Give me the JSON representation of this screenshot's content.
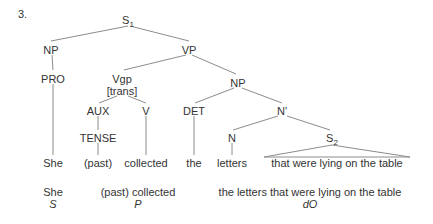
{
  "item": {
    "number": "3."
  },
  "colors": {
    "background": "#ffffff",
    "line": "#8c8c8c",
    "text": "#333333"
  },
  "tree": {
    "nodes": [
      {
        "id": "S1",
        "label": "S",
        "subscript": "1",
        "x": 128,
        "y": 20
      },
      {
        "id": "NP1",
        "label": "NP",
        "subscript": "",
        "x": 51,
        "y": 50
      },
      {
        "id": "VP",
        "label": "VP",
        "subscript": "",
        "x": 189,
        "y": 50
      },
      {
        "id": "PRO",
        "label": "PRO",
        "subscript": "",
        "x": 53,
        "y": 79
      },
      {
        "id": "Vgp",
        "label": "Vgp",
        "subscript": "",
        "x": 122,
        "y": 79
      },
      {
        "id": "trans",
        "label": "[trans]",
        "subscript": "",
        "x": 122,
        "y": 91
      },
      {
        "id": "NP2",
        "label": "NP",
        "subscript": "",
        "x": 238,
        "y": 83
      },
      {
        "id": "AUX",
        "label": "AUX",
        "subscript": "",
        "x": 98,
        "y": 111
      },
      {
        "id": "V",
        "label": "V",
        "subscript": "",
        "x": 146,
        "y": 111
      },
      {
        "id": "DET",
        "label": "DET",
        "subscript": "",
        "x": 194,
        "y": 111
      },
      {
        "id": "Nbar",
        "label": "N'",
        "subscript": "",
        "x": 282,
        "y": 111
      },
      {
        "id": "TENSE",
        "label": "TENSE",
        "subscript": "",
        "x": 98,
        "y": 138
      },
      {
        "id": "N",
        "label": "N",
        "subscript": "",
        "x": 232,
        "y": 138
      },
      {
        "id": "S2",
        "label": "S",
        "subscript": "2",
        "x": 332,
        "y": 138
      }
    ],
    "terminals": [
      {
        "id": "t-she",
        "label": "She",
        "x": 53,
        "y": 163
      },
      {
        "id": "t-past",
        "label": "(past)",
        "x": 98,
        "y": 163
      },
      {
        "id": "t-collected",
        "label": "collected",
        "x": 146,
        "y": 163
      },
      {
        "id": "t-the",
        "label": "the",
        "x": 194,
        "y": 163
      },
      {
        "id": "t-letters",
        "label": "letters",
        "x": 232,
        "y": 163
      },
      {
        "id": "t-clause",
        "label": "that were lying on the table",
        "x": 337,
        "y": 163
      }
    ]
  },
  "gloss": [
    {
      "id": "g-subject",
      "words": "She",
      "tag": "S",
      "x": 53,
      "y": 191
    },
    {
      "id": "g-predicate",
      "words": "(past) collected",
      "tag": "P",
      "x": 138,
      "y": 191
    },
    {
      "id": "g-object",
      "words": "the letters that were lying on the table",
      "tag": "dO",
      "x": 310,
      "y": 191
    }
  ]
}
